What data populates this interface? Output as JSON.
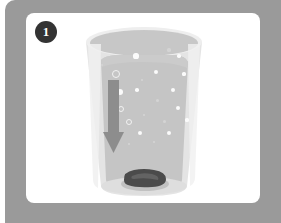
{
  "illustration": {
    "title": "Step 1 - drop tablet into glass of water",
    "step_badge": "1",
    "frame_color": "#9a9a9a",
    "panel_color": "#ffffff",
    "badge_color": "#333333"
  },
  "scene": {
    "glass": {
      "name": "drinking-glass",
      "body_color": "#e3e3e3",
      "rim_color": "#c9c9c9",
      "rim_highlight_color": "#efefef"
    },
    "liquid": {
      "name": "water",
      "color": "#c4c4c4",
      "surface_label": "water surface"
    },
    "arrow": {
      "name": "downward-arrow",
      "direction": "down",
      "color": "#8f8f8f"
    },
    "tablet": {
      "name": "effervescent-tablet",
      "color": "#4a4a4a",
      "position": "glass bottom"
    },
    "bubbles": [
      {
        "x": 62,
        "y": 36,
        "r": 2.6,
        "style": "solid"
      },
      {
        "x": 95,
        "y": 30,
        "r": 1.6,
        "style": "faint"
      },
      {
        "x": 105,
        "y": 36,
        "r": 1.7,
        "style": "solid"
      },
      {
        "x": 28,
        "y": 45,
        "r": 1.2,
        "style": "faint"
      },
      {
        "x": 41,
        "y": 53,
        "r": 3.0,
        "style": "ring"
      },
      {
        "x": 82,
        "y": 52,
        "r": 2.0,
        "style": "solid"
      },
      {
        "x": 68,
        "y": 60,
        "r": 1.4,
        "style": "faint"
      },
      {
        "x": 110,
        "y": 54,
        "r": 1.6,
        "style": "solid"
      },
      {
        "x": 46,
        "y": 72,
        "r": 3.2,
        "style": "solid"
      },
      {
        "x": 63,
        "y": 70,
        "r": 1.8,
        "style": "solid"
      },
      {
        "x": 99,
        "y": 70,
        "r": 2.0,
        "style": "solid"
      },
      {
        "x": 83,
        "y": 80,
        "r": 1.5,
        "style": "faint"
      },
      {
        "x": 46,
        "y": 88,
        "r": 2.0,
        "style": "ring"
      },
      {
        "x": 104,
        "y": 88,
        "r": 2.2,
        "style": "solid"
      },
      {
        "x": 70,
        "y": 95,
        "r": 1.4,
        "style": "faint"
      },
      {
        "x": 54,
        "y": 101,
        "r": 2.4,
        "style": "ring"
      },
      {
        "x": 90,
        "y": 101,
        "r": 1.5,
        "style": "faint"
      },
      {
        "x": 113,
        "y": 100,
        "r": 1.6,
        "style": "solid"
      },
      {
        "x": 40,
        "y": 113,
        "r": 2.2,
        "style": "solid"
      },
      {
        "x": 66,
        "y": 113,
        "r": 2.0,
        "style": "solid"
      },
      {
        "x": 95,
        "y": 113,
        "r": 2.4,
        "style": "solid"
      },
      {
        "x": 55,
        "y": 124,
        "r": 1.4,
        "style": "faint"
      },
      {
        "x": 80,
        "y": 122,
        "r": 1.3,
        "style": "faint"
      }
    ]
  }
}
